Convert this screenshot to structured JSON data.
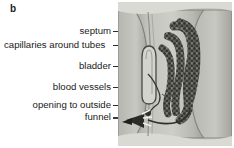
{
  "figure": {
    "panel_letter": "b"
  },
  "labels": [
    {
      "id": "septum",
      "text": "septum"
    },
    {
      "id": "capillaries",
      "text": "capillaries around tubes"
    },
    {
      "id": "bladder",
      "text": "bladder"
    },
    {
      "id": "blood-vessels",
      "text": "blood vessels"
    },
    {
      "id": "opening-to-outside",
      "text": "opening to outside"
    },
    {
      "id": "funnel",
      "text": "funnel"
    }
  ],
  "colors": {
    "background": "#ffffff",
    "text": "#1a1a1a",
    "leader_line": "#2a2a2a",
    "body_wall": "#c9c9c4",
    "segment_fill": "#b4b4ae",
    "segment_shade": "#9a9a94",
    "segment_outline": "#6e6e68",
    "tubule_dark": "#3d3d39",
    "tubule_mid": "#6a6a64",
    "bladder_fill": "#d2d2cc",
    "funnel_dark": "#2b2b27"
  }
}
